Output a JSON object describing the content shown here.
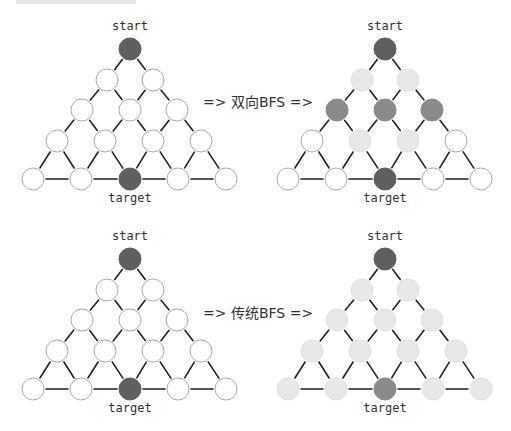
{
  "colors": {
    "dark": "#5f5f5f",
    "medium": "#8a8a8a",
    "light": "#e8e8e8",
    "white": "#ffffff",
    "edge": "#222222",
    "outline": "#aaaaaa"
  },
  "panels": [
    {
      "id": "bidirectional-before",
      "offset": [
        0,
        0
      ],
      "start_label": "start",
      "target_label": "target",
      "states": [
        [
          "dark"
        ],
        [
          "white",
          "white"
        ],
        [
          "white",
          "white",
          "white"
        ],
        [
          "white",
          "white",
          "white",
          "white"
        ],
        [
          "white",
          "white",
          "dark",
          "white",
          "white"
        ]
      ]
    },
    {
      "id": "bidirectional-after",
      "offset": [
        255,
        0
      ],
      "start_label": "start",
      "target_label": "target",
      "states": [
        [
          "dark"
        ],
        [
          "light",
          "light"
        ],
        [
          "medium",
          "medium",
          "medium"
        ],
        [
          "white",
          "light",
          "light",
          "white"
        ],
        [
          "white",
          "white",
          "dark",
          "white",
          "white"
        ]
      ]
    },
    {
      "id": "traditional-before",
      "offset": [
        0,
        210
      ],
      "start_label": "start",
      "target_label": "target",
      "states": [
        [
          "dark"
        ],
        [
          "white",
          "white"
        ],
        [
          "white",
          "white",
          "white"
        ],
        [
          "white",
          "white",
          "white",
          "white"
        ],
        [
          "white",
          "white",
          "dark",
          "white",
          "white"
        ]
      ]
    },
    {
      "id": "traditional-after",
      "offset": [
        255,
        210
      ],
      "start_label": "start",
      "target_label": "target",
      "states": [
        [
          "dark"
        ],
        [
          "light",
          "light"
        ],
        [
          "light",
          "light",
          "light"
        ],
        [
          "light",
          "light",
          "light",
          "light"
        ],
        [
          "light",
          "light",
          "medium",
          "light",
          "light"
        ]
      ]
    }
  ],
  "transitions": [
    {
      "label": "=> 双向BFS =>",
      "x": 203,
      "y": 107
    },
    {
      "label": "=> 传统BFS =>",
      "x": 203,
      "y": 318
    }
  ]
}
